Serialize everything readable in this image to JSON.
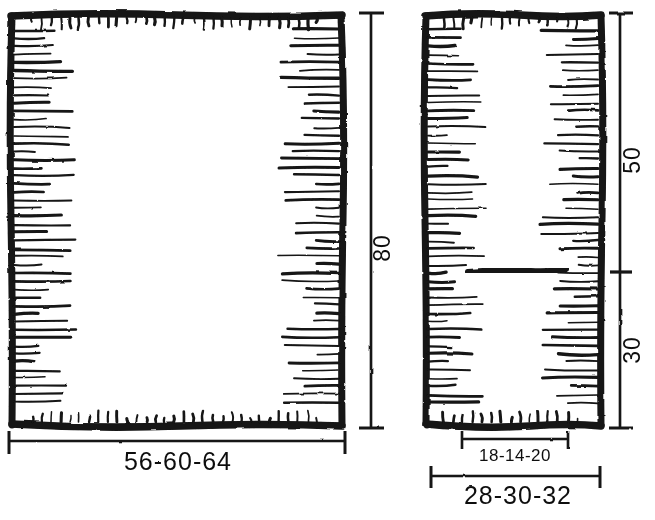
{
  "drawing": {
    "title": "Hand-drawn furniture elevation and side-view sketch with dimensions",
    "background_color": "#ffffff",
    "ink_color": "#111111",
    "views": [
      {
        "name": "front-elevation",
        "label": "front view",
        "outline": {
          "x": 10,
          "y": 14,
          "width": 333,
          "height": 412
        },
        "hatching": "inward-tapered-strokes"
      },
      {
        "name": "side-elevation",
        "label": "side view",
        "outline": {
          "x": 424,
          "y": 14,
          "width": 178,
          "height": 412
        },
        "hatching": "inward-tapered-strokes",
        "interior_mark": {
          "x1": 468,
          "y1": 271,
          "x2": 566,
          "y2": 269
        }
      }
    ],
    "dimensions": [
      {
        "id": "overall-height",
        "value": "80",
        "orientation": "vertical",
        "applies_to": "front-elevation",
        "position": "right-of-front-view"
      },
      {
        "id": "overall-width",
        "value": "56-60-64",
        "orientation": "horizontal",
        "applies_to": "front-elevation",
        "position": "below-front-view"
      },
      {
        "id": "upper-height",
        "value": "50",
        "orientation": "vertical",
        "applies_to": "side-elevation",
        "position": "right-of-side-view-upper"
      },
      {
        "id": "lower-height",
        "value": "30",
        "orientation": "vertical",
        "applies_to": "side-elevation",
        "position": "right-of-side-view-lower"
      },
      {
        "id": "inner-depth",
        "value": "18-14-20",
        "orientation": "horizontal",
        "applies_to": "side-elevation",
        "position": "below-side-view-inner"
      },
      {
        "id": "overall-depth",
        "value": "28-30-32",
        "orientation": "horizontal",
        "applies_to": "side-elevation",
        "position": "below-side-view-outer"
      }
    ]
  }
}
